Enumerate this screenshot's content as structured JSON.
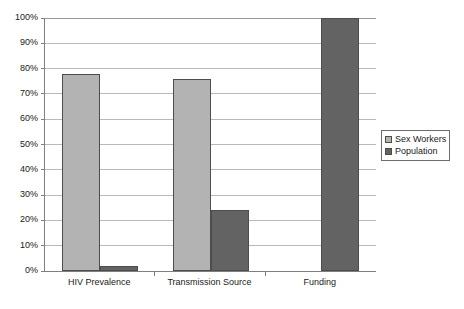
{
  "chart_data": {
    "type": "bar",
    "title": "",
    "subtitle": "",
    "xlabel": "",
    "ylabel": "",
    "categories": [
      "HIV Prevalence",
      "Transmission Source",
      "Funding"
    ],
    "series": [
      {
        "name": "Sex Workers",
        "color": "#b3b3b3",
        "values": [
          78,
          76,
          0
        ]
      },
      {
        "name": "Population",
        "color": "#636363",
        "values": [
          2,
          24,
          100
        ]
      }
    ],
    "ylim": [
      0,
      100
    ],
    "ytick_values": [
      0,
      10,
      20,
      30,
      40,
      50,
      60,
      70,
      80,
      90,
      100
    ],
    "ytick_labels": [
      "0%",
      "10%",
      "20%",
      "30%",
      "40%",
      "50%",
      "60%",
      "70%",
      "80%",
      "90%",
      "100%"
    ],
    "value_format": "percent",
    "grid": {
      "horizontal": true,
      "vertical": false
    },
    "legend": {
      "position": "right",
      "entries": [
        {
          "label": "Sex Workers",
          "swatch": "#b3b3b3"
        },
        {
          "label": "Population",
          "swatch": "#636363"
        }
      ]
    },
    "axis_color": "#7f7f7f",
    "gridline_color": "#b9b9b9",
    "background": "#ffffff"
  }
}
